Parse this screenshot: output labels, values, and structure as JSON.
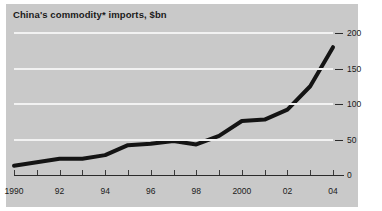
{
  "chart_data": {
    "type": "line",
    "title": "China's commodity* imports, $bn",
    "xlabel": "",
    "ylabel": "",
    "x": [
      1990,
      1991,
      1992,
      1993,
      1994,
      1995,
      1996,
      1997,
      1998,
      1999,
      2000,
      2001,
      2002,
      2003,
      2004
    ],
    "values": [
      13,
      18,
      23,
      23,
      28,
      42,
      44,
      48,
      43,
      55,
      76,
      78,
      92,
      125,
      180
    ],
    "xtick_labels": [
      "1990",
      "92",
      "94",
      "96",
      "98",
      "2000",
      "02",
      "04"
    ],
    "xtick_years": [
      1990,
      1992,
      1994,
      1996,
      1998,
      2000,
      2002,
      2004
    ],
    "ytick_labels": [
      "0",
      "50",
      "100",
      "150",
      "200"
    ],
    "ytick_values": [
      0,
      50,
      100,
      150,
      200
    ],
    "ylim": [
      0,
      200
    ],
    "xlim": [
      1990,
      2004
    ],
    "grid": true,
    "legend": "none",
    "series_color": "#141414",
    "grid_color": "#f2f2f2",
    "panel_color": "#c9c9c9",
    "axis_color": "#2b2b2b",
    "line_width": 4
  }
}
